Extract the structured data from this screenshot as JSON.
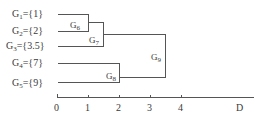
{
  "dendrogram": {
    "leaves": [
      {
        "id": "G1",
        "name": "G",
        "sub": "1",
        "set": "={1}"
      },
      {
        "id": "G2",
        "name": "G",
        "sub": "2",
        "set": "={2}"
      },
      {
        "id": "G3",
        "name": "G",
        "sub": "3",
        "set": "={3.5}"
      },
      {
        "id": "G4",
        "name": "G",
        "sub": "4",
        "set": "={7}"
      },
      {
        "id": "G5",
        "name": "G",
        "sub": "5",
        "set": "={9}"
      }
    ],
    "merges": [
      {
        "id": "G6",
        "name": "G",
        "sub": "6",
        "children": [
          "G1",
          "G2"
        ],
        "distance": 1
      },
      {
        "id": "G7",
        "name": "G",
        "sub": "7",
        "children": [
          "G6",
          "G3"
        ],
        "distance": 1.5
      },
      {
        "id": "G8",
        "name": "G",
        "sub": "8",
        "children": [
          "G4",
          "G5"
        ],
        "distance": 2
      },
      {
        "id": "G9",
        "name": "G",
        "sub": "9",
        "children": [
          "G7",
          "G8"
        ],
        "distance": 3.5
      }
    ]
  },
  "axis": {
    "ticks": [
      "0",
      "1",
      "2",
      "3",
      "4"
    ],
    "label": "D"
  },
  "colors": {
    "line": "#555555",
    "text": "#3a3a3a"
  }
}
